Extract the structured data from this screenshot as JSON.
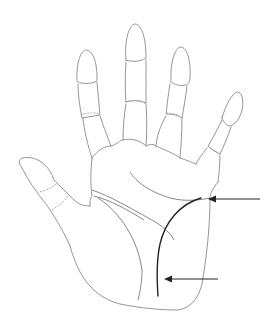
{
  "figure": {
    "background": "#ffffff",
    "line_color": "#8a8a8a",
    "highlight_color": "#222222",
    "fingers": [
      "thumb",
      "index",
      "middle",
      "ring",
      "little"
    ],
    "highlighted_line": "fate-line",
    "arrows": [
      {
        "name": "upper-arrow",
        "points_to": "top of highlighted line"
      },
      {
        "name": "lower-arrow",
        "points_to": "bottom of highlighted line"
      }
    ]
  }
}
